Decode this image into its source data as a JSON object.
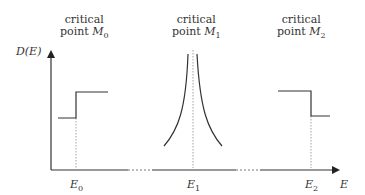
{
  "diagram": {
    "y_axis_label": "D(E)",
    "x_axis_label": "E",
    "critical_points": [
      {
        "line1": "critical",
        "line2_prefix": "point ",
        "symbol": "M",
        "sub": "0",
        "energy": "E",
        "energy_sub": "0",
        "shape": "step-up"
      },
      {
        "line1": "critical",
        "line2_prefix": "point ",
        "symbol": "M",
        "sub": "1",
        "energy": "E",
        "energy_sub": "1",
        "shape": "divergence"
      },
      {
        "line1": "critical",
        "line2_prefix": "point ",
        "symbol": "M",
        "sub": "2",
        "energy": "E",
        "energy_sub": "2",
        "shape": "step-down"
      }
    ],
    "colors": {
      "line": "#333333",
      "dotted": "#888888",
      "text": "#333333"
    }
  }
}
